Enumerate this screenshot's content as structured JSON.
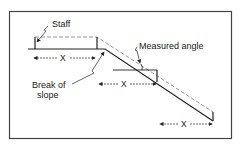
{
  "diagram": {
    "labels": {
      "staff": "Staff",
      "measured_angle": "Measured angle",
      "break_of_slope_line1": "Break of",
      "break_of_slope_line2": "slope"
    },
    "distance_labels": [
      "X",
      "X",
      "X"
    ],
    "colors": {
      "line": "#222222",
      "dashed": "#9a9a9a",
      "frame": "#444444",
      "background": "#ffffff"
    }
  }
}
